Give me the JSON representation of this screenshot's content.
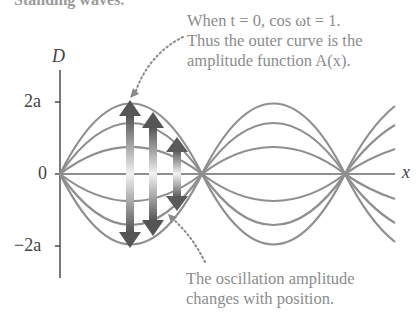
{
  "figure": {
    "cut_title": "Standing waves.",
    "annotation_top": {
      "line1": "When t = 0, cos ωt = 1.",
      "line2": "Thus the outer curve is the",
      "line3": "amplitude function A(x)."
    },
    "annotation_bottom": {
      "line1": "The oscillation amplitude",
      "line2": "changes with position."
    },
    "axes": {
      "y_label": "D",
      "x_label": "x",
      "y_ticks": [
        "2a",
        "0",
        "−2a"
      ]
    },
    "colors": {
      "curve": "#8a8a8a",
      "axis": "#333333",
      "text": "#8c8c8c",
      "arrow_dark": "#555555"
    }
  }
}
